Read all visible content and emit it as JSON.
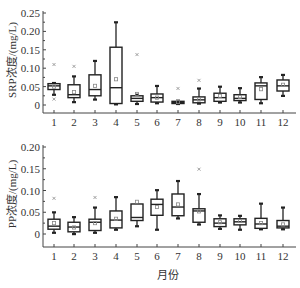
{
  "chart_data": [
    {
      "type": "box",
      "panel": "top",
      "title": "",
      "xlabel": "",
      "ylabel": "SRP浓度/(mg/L)",
      "ylim": [
        0,
        0.25
      ],
      "yticks": [
        0,
        0.05,
        0.1,
        0.15,
        0.2,
        0.25
      ],
      "ytick_labels": [
        "0",
        "0.05",
        "0.10",
        "0.15",
        "0.20",
        "0.25"
      ],
      "categories": [
        "1",
        "2",
        "3",
        "4",
        "5",
        "6",
        "7",
        "8",
        "9",
        "10",
        "11",
        "12"
      ],
      "grid": false,
      "series": [
        {
          "name": "SRP",
          "boxes": [
            {
              "month": "1",
              "whisker_low": 0.028,
              "q1": 0.042,
              "median": 0.052,
              "q3": 0.058,
              "whisker_high": 0.06,
              "mean": 0.05,
              "outliers": [
                0.11,
                0.016
              ]
            },
            {
              "month": "2",
              "whisker_low": 0.008,
              "q1": 0.02,
              "median": 0.028,
              "q3": 0.055,
              "whisker_high": 0.078,
              "mean": 0.035,
              "outliers": [
                0.105
              ]
            },
            {
              "month": "3",
              "whisker_low": 0.015,
              "q1": 0.025,
              "median": 0.042,
              "q3": 0.082,
              "whisker_high": 0.12,
              "mean": 0.052,
              "outliers": []
            },
            {
              "month": "4",
              "whisker_low": 0.002,
              "q1": 0.004,
              "median": 0.047,
              "q3": 0.157,
              "whisker_high": 0.225,
              "mean": 0.07,
              "outliers": []
            },
            {
              "month": "5",
              "whisker_low": 0.003,
              "q1": 0.01,
              "median": 0.018,
              "q3": 0.025,
              "whisker_high": 0.028,
              "mean": 0.03,
              "outliers": [
                0.137
              ]
            },
            {
              "month": "6",
              "whisker_low": 0.005,
              "q1": 0.008,
              "median": 0.02,
              "q3": 0.03,
              "whisker_high": 0.052,
              "mean": 0.02,
              "outliers": []
            },
            {
              "month": "7",
              "whisker_low": 0.003,
              "q1": 0.004,
              "median": 0.007,
              "q3": 0.01,
              "whisker_high": 0.012,
              "mean": 0.008,
              "outliers": [
                0.045
              ]
            },
            {
              "month": "8",
              "whisker_low": 0.004,
              "q1": 0.006,
              "median": 0.014,
              "q3": 0.022,
              "whisker_high": 0.045,
              "mean": 0.015,
              "outliers": [
                0.067
              ]
            },
            {
              "month": "9",
              "whisker_low": 0.007,
              "q1": 0.01,
              "median": 0.02,
              "q3": 0.032,
              "whisker_high": 0.05,
              "mean": 0.025,
              "outliers": []
            },
            {
              "month": "10",
              "whisker_low": 0.007,
              "q1": 0.012,
              "median": 0.018,
              "q3": 0.028,
              "whisker_high": 0.046,
              "mean": 0.022,
              "outliers": []
            },
            {
              "month": "11",
              "whisker_low": 0.005,
              "q1": 0.015,
              "median": 0.052,
              "q3": 0.06,
              "whisker_high": 0.076,
              "mean": 0.043,
              "outliers": []
            },
            {
              "month": "12",
              "whisker_low": 0.025,
              "q1": 0.038,
              "median": 0.052,
              "q3": 0.068,
              "whisker_high": 0.082,
              "mean": 0.055,
              "outliers": []
            }
          ]
        }
      ]
    },
    {
      "type": "box",
      "panel": "bottom",
      "title": "",
      "xlabel": "月份",
      "ylabel": "PP浓度/(mg/L)",
      "ylim": [
        0,
        0.2
      ],
      "yticks": [
        0,
        0.05,
        0.1,
        0.15,
        0.2
      ],
      "ytick_labels": [
        "0",
        "0.05",
        "0.10",
        "0.15",
        "0.20"
      ],
      "categories": [
        "1",
        "2",
        "3",
        "4",
        "5",
        "6",
        "7",
        "8",
        "9",
        "10",
        "11",
        "12"
      ],
      "grid": false,
      "series": [
        {
          "name": "PP",
          "boxes": [
            {
              "month": "1",
              "whisker_low": 0.003,
              "q1": 0.011,
              "median": 0.018,
              "q3": 0.034,
              "whisker_high": 0.05,
              "mean": 0.025,
              "outliers": [
                0.082
              ]
            },
            {
              "month": "2",
              "whisker_low": 0.0,
              "q1": 0.005,
              "median": 0.016,
              "q3": 0.027,
              "whisker_high": 0.039,
              "mean": 0.015,
              "outliers": []
            },
            {
              "month": "3",
              "whisker_low": 0.003,
              "q1": 0.008,
              "median": 0.027,
              "q3": 0.034,
              "whisker_high": 0.061,
              "mean": 0.025,
              "outliers": [
                0.084
              ]
            },
            {
              "month": "4",
              "whisker_low": 0.01,
              "q1": 0.014,
              "median": 0.032,
              "q3": 0.053,
              "whisker_high": 0.085,
              "mean": 0.035,
              "outliers": []
            },
            {
              "month": "5",
              "whisker_low": 0.018,
              "q1": 0.031,
              "median": 0.038,
              "q3": 0.069,
              "whisker_high": 0.069,
              "mean": 0.074,
              "outliers": []
            },
            {
              "month": "6",
              "whisker_low": 0.01,
              "q1": 0.043,
              "median": 0.068,
              "q3": 0.08,
              "whisker_high": 0.101,
              "mean": 0.062,
              "outliers": []
            },
            {
              "month": "7",
              "whisker_low": 0.036,
              "q1": 0.042,
              "median": 0.062,
              "q3": 0.092,
              "whisker_high": 0.122,
              "mean": 0.068,
              "outliers": []
            },
            {
              "month": "8",
              "whisker_low": 0.022,
              "q1": 0.027,
              "median": 0.053,
              "q3": 0.058,
              "whisker_high": 0.092,
              "mean": 0.052,
              "outliers": [
                0.149
              ]
            },
            {
              "month": "9",
              "whisker_low": 0.012,
              "q1": 0.017,
              "median": 0.025,
              "q3": 0.035,
              "whisker_high": 0.043,
              "mean": 0.027,
              "outliers": []
            },
            {
              "month": "10",
              "whisker_low": 0.01,
              "q1": 0.021,
              "median": 0.028,
              "q3": 0.035,
              "whisker_high": 0.042,
              "mean": 0.03,
              "outliers": []
            },
            {
              "month": "11",
              "whisker_low": 0.011,
              "q1": 0.013,
              "median": 0.023,
              "q3": 0.036,
              "whisker_high": 0.07,
              "mean": 0.025,
              "outliers": []
            },
            {
              "month": "12",
              "whisker_low": 0.011,
              "q1": 0.014,
              "median": 0.018,
              "q3": 0.031,
              "whisker_high": 0.061,
              "mean": 0.022,
              "outliers": []
            }
          ]
        }
      ]
    }
  ],
  "figure": {
    "top_ylabel": "SRP浓度/(mg/L)",
    "bottom_ylabel": "PP浓度/(mg/L)",
    "xlabel": "月份"
  }
}
